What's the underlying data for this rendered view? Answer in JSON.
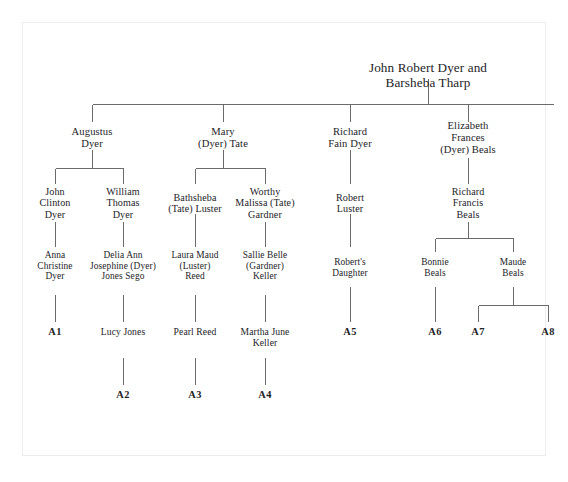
{
  "document": {
    "type": "family-tree-chart",
    "title": "John Robert Dyer and Barsheba Tharp descendant chart",
    "background_color": "#ffffff",
    "line_color": "#6b6b6b",
    "text_color": "#23231f"
  },
  "tree": {
    "root": {
      "label": "John Robert Dyer and Barsheba Tharp"
    },
    "generation_1": [
      {
        "label": "Augustus\nDyer"
      },
      {
        "label": "Mary\n(Dyer) Tate"
      },
      {
        "label": "Richard\nFain Dyer"
      },
      {
        "label": "Elizabeth\nFrances\n(Dyer) Beals"
      }
    ],
    "generation_2": [
      {
        "label": "John\nClinton\nDyer"
      },
      {
        "label": "William\nThomas\nDyer"
      },
      {
        "label": "Bathsheba\n(Tate) Luster"
      },
      {
        "label": "Worthy\nMalissa (Tate)\nGardner"
      },
      {
        "label": "Robert\nLuster"
      },
      {
        "label": "Richard\nFrancis\nBeals"
      }
    ],
    "generation_3": [
      {
        "label": "Anna\nChristine\nDyer"
      },
      {
        "label": "Delia Ann\nJosephine (Dyer)\nJones Sego"
      },
      {
        "label": "Laura Maud\n(Luster)\nReed"
      },
      {
        "label": "Sallie Belle\n(Gardner)\nKeller"
      },
      {
        "label": "Robert's\nDaughter"
      },
      {
        "label": "Bonnie\nBeals"
      },
      {
        "label": "Maude\nBeals"
      }
    ],
    "generation_4": [
      {
        "label": "A1",
        "is_code": true
      },
      {
        "label": "Lucy Jones",
        "is_code": false
      },
      {
        "label": "Pearl Reed",
        "is_code": false
      },
      {
        "label": "Martha June\nKeller",
        "is_code": false
      },
      {
        "label": "A5",
        "is_code": true
      },
      {
        "label": "A6",
        "is_code": true
      },
      {
        "label": "A7",
        "is_code": true
      },
      {
        "label": "A8",
        "is_code": true
      }
    ],
    "generation_5": [
      {
        "label": "A2"
      },
      {
        "label": "A3"
      },
      {
        "label": "A4"
      }
    ]
  }
}
